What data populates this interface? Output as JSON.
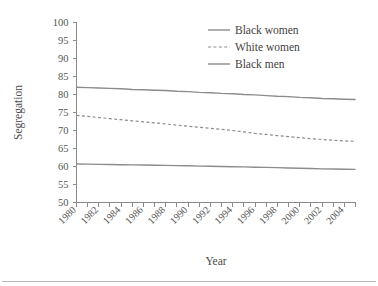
{
  "chart_data": {
    "type": "line",
    "title": "",
    "xlabel": "Year",
    "ylabel": "Segregation",
    "xlim": [
      1980,
      2005
    ],
    "ylim": [
      50,
      100
    ],
    "yticks": [
      50,
      55,
      60,
      65,
      70,
      75,
      80,
      85,
      90,
      95,
      100
    ],
    "xticks": [
      1980,
      1981,
      1982,
      1983,
      1984,
      1985,
      1986,
      1987,
      1988,
      1989,
      1990,
      1991,
      1992,
      1993,
      1994,
      1995,
      1996,
      1997,
      1998,
      1999,
      2000,
      2001,
      2002,
      2003,
      2004,
      2005
    ],
    "xtick_labels": [
      "1980",
      "1982",
      "1984",
      "1986",
      "1988",
      "1990",
      "1992",
      "1994",
      "1996",
      "1998",
      "2000",
      "2002",
      "2004"
    ],
    "xtick_label_years": [
      1980,
      1982,
      1984,
      1986,
      1988,
      1990,
      1992,
      1994,
      1996,
      1998,
      2000,
      2002,
      2004
    ],
    "xtick_label_rotation": -45,
    "grid": false,
    "legend_position": "top-right",
    "x": [
      1980,
      1981,
      1982,
      1983,
      1984,
      1985,
      1986,
      1987,
      1988,
      1989,
      1990,
      1991,
      1992,
      1993,
      1994,
      1995,
      1996,
      1997,
      1998,
      1999,
      2000,
      2001,
      2002,
      2003,
      2004,
      2005
    ],
    "series": [
      {
        "name": "Black women",
        "style": "solid",
        "color": "#8c8c8c",
        "values": [
          82.0,
          81.9,
          81.8,
          81.7,
          81.6,
          81.4,
          81.3,
          81.2,
          81.1,
          80.9,
          80.8,
          80.6,
          80.5,
          80.3,
          80.2,
          80.0,
          79.9,
          79.7,
          79.5,
          79.4,
          79.2,
          79.1,
          78.9,
          78.8,
          78.7,
          78.6
        ]
      },
      {
        "name": "White women",
        "style": "dashed",
        "color": "#8c8c8c",
        "values": [
          74.2,
          73.9,
          73.6,
          73.3,
          73.0,
          72.7,
          72.4,
          72.1,
          71.8,
          71.5,
          71.2,
          70.9,
          70.6,
          70.3,
          70.0,
          69.6,
          69.2,
          68.9,
          68.6,
          68.3,
          68.0,
          67.7,
          67.5,
          67.3,
          67.1,
          67.0
        ]
      },
      {
        "name": "Black men",
        "style": "solid",
        "color": "#8c8c8c",
        "values": [
          60.7,
          60.65,
          60.6,
          60.55,
          60.5,
          60.45,
          60.4,
          60.35,
          60.3,
          60.25,
          60.2,
          60.1,
          60.05,
          60.0,
          59.95,
          59.9,
          59.8,
          59.75,
          59.7,
          59.6,
          59.5,
          59.45,
          59.35,
          59.3,
          59.25,
          59.2
        ]
      }
    ]
  },
  "legend": {
    "items": [
      {
        "label": "Black women"
      },
      {
        "label": "White women"
      },
      {
        "label": "Black men"
      }
    ]
  },
  "axes": {
    "y_title": "Segregation",
    "x_title": "Year"
  }
}
